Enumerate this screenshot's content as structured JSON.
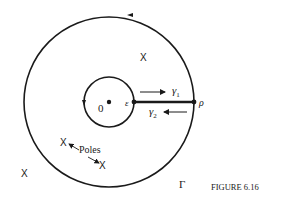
{
  "figure": {
    "caption": "FIGURE 6.16",
    "contour_label": "Γ",
    "origin_label": "0",
    "epsilon_label": "ε",
    "rho_label": "ρ",
    "gamma1_label": "γ",
    "gamma1_sub": "1",
    "gamma2_label": "γ",
    "gamma2_sub": "2",
    "poles_label": "Poles",
    "pole_marker": "X",
    "colors": {
      "stroke": "#1a1a1a",
      "background": "#ffffff"
    }
  }
}
